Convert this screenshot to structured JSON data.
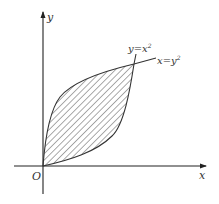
{
  "figure": {
    "axes": {
      "x_label": "x",
      "y_label": "y",
      "origin_label": "O"
    },
    "curves": [
      {
        "name": "parabola-y-eq-x-squared",
        "label": "y=x",
        "label_sup": "2"
      },
      {
        "name": "parabola-x-eq-y-squared",
        "label": "x=y",
        "label_sup": "2"
      }
    ],
    "shaded_region": {
      "pattern": "diagonal-hatch",
      "bounded_by": [
        "y=x^2",
        "x=y^2"
      ]
    },
    "colors": {
      "line": "#333333",
      "hatch": "#555555",
      "background": "#ffffff"
    }
  }
}
